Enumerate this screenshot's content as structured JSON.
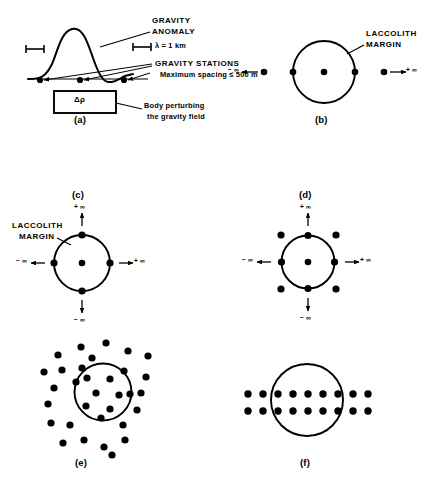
{
  "figure": {
    "background_color": "#ffffff",
    "ink_color": "#000000",
    "width": 433,
    "height": 480
  },
  "panel_a": {
    "letter": "(a)",
    "label_gravity_anomaly_line1": "GRAVITY",
    "label_gravity_anomaly_line2": "ANOMALY",
    "label_wavelength": "λ = 1 km",
    "label_gravity_stations": "GRAVITY STATIONS",
    "label_max_spacing": "Maximum spacing ≤ 500 m",
    "label_body_line1": "Body perturbing",
    "label_body_line2": "the gravity field",
    "box_label": "Δρ",
    "station_count": 3
  },
  "panel_b": {
    "letter": "(b)",
    "label_margin_line1": "LACCOLITH",
    "label_margin_line2": "MARGIN",
    "label_neg_infinity": "− ∞",
    "label_pos_infinity": "+ ∞",
    "station_count_visible": 5,
    "description": "Single profile line of stations crossing the laccolith"
  },
  "panel_c": {
    "letter": "(c)",
    "label_margin_line1": "LACCOLITH",
    "label_margin_line2": "MARGIN",
    "label_top_infinity": "+ ∞",
    "label_bottom_infinity": "− ∞",
    "label_left_infinity": "− ∞",
    "label_right_infinity": "+ ∞",
    "station_count": 5,
    "description": "Two orthogonal profiles crossing at the center"
  },
  "panel_d": {
    "letter": "(d)",
    "label_top_infinity": "+ ∞",
    "label_bottom_infinity": "− ∞",
    "label_left_infinity": "− ∞",
    "label_right_infinity": "+ ∞",
    "station_count": 9,
    "description": "Orthogonal profiles plus four diagonal outer stations"
  },
  "panel_e": {
    "letter": "(e)",
    "station_count": 32,
    "description": "Randomly scattered stations inside and outside the margin"
  },
  "panel_f": {
    "letter": "(f)",
    "rows": 2,
    "stations_per_row": 9,
    "station_count": 18,
    "description": "Two regularly spaced parallel profile lines"
  }
}
